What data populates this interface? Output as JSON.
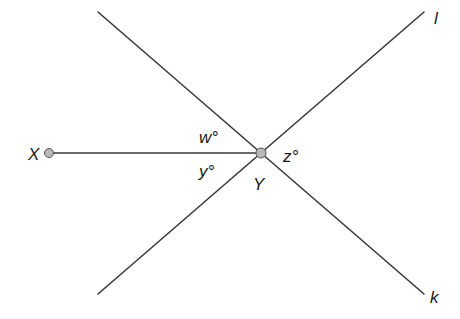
{
  "diagram": {
    "type": "geometry-angles",
    "points": [
      {
        "id": "X",
        "label": "X"
      },
      {
        "id": "Y",
        "label": "Y"
      }
    ],
    "lines": [
      {
        "id": "l",
        "label": "l"
      },
      {
        "id": "k",
        "label": "k"
      }
    ],
    "segments": [
      {
        "from": "X",
        "to": "Y"
      }
    ],
    "angles": [
      {
        "id": "w",
        "label": "w°"
      },
      {
        "id": "y",
        "label": "y°"
      },
      {
        "id": "z",
        "label": "z°"
      }
    ],
    "colors": {
      "line": "#3a3a3a",
      "point_fill": "#b8b8b8",
      "text": "#1a1a1a"
    }
  }
}
